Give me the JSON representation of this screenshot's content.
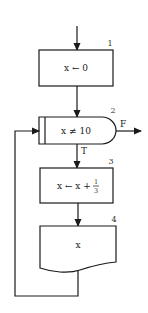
{
  "diagram": {
    "type": "flowchart",
    "nodes": [
      {
        "id": "1",
        "shape": "process",
        "number": "1",
        "label": "x ← 0"
      },
      {
        "id": "2",
        "shape": "decision",
        "number": "2",
        "label": "x ≠ 10",
        "true_label": "T",
        "false_label": "F"
      },
      {
        "id": "3",
        "shape": "process",
        "number": "3",
        "label_prefix": "x ← x + ",
        "frac_num": "1",
        "frac_den": "3"
      },
      {
        "id": "4",
        "shape": "document",
        "number": "4",
        "label": "x"
      }
    ],
    "edges": [
      {
        "from": "start",
        "to": "1"
      },
      {
        "from": "1",
        "to": "2"
      },
      {
        "from": "2",
        "to": "3",
        "label": "T"
      },
      {
        "from": "2",
        "to": "exit",
        "label": "F"
      },
      {
        "from": "3",
        "to": "4"
      },
      {
        "from": "4",
        "to": "2",
        "type": "loop-back"
      }
    ],
    "colors": {
      "line": "#1a1a1a",
      "background": "#ffffff"
    }
  }
}
